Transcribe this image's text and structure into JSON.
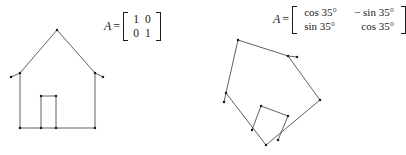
{
  "figure": {
    "background_color": "#ffffff",
    "stroke_color": "#3a3a3a",
    "vertex_color": "#1a1a1a",
    "stroke_width": 0.8,
    "vertex_size": 2.2
  },
  "panels": [
    {
      "id": "original-house",
      "label": "original house",
      "matrix": {
        "variable": "A",
        "equals": "=",
        "rows": [
          [
            "1",
            "0"
          ],
          [
            "0",
            "1"
          ]
        ],
        "description": "identity matrix"
      },
      "shape": {
        "outline": [
          [
            20,
            73
          ],
          [
            57,
            30
          ],
          [
            95,
            73
          ],
          [
            95,
            128
          ],
          [
            20,
            128
          ]
        ],
        "eaves": [
          [
            [
              20,
              73
            ],
            [
              11,
              77
            ]
          ],
          [
            [
              95,
              73
            ],
            [
              103,
              77
            ]
          ]
        ],
        "door": [
          [
            41,
            128
          ],
          [
            41,
            96
          ],
          [
            56,
            96
          ],
          [
            56,
            128
          ]
        ],
        "base": [
          [
            20,
            128
          ],
          [
            95,
            128
          ]
        ],
        "vertices": [
          [
            57,
            30
          ],
          [
            11,
            77
          ],
          [
            20,
            73
          ],
          [
            95,
            73
          ],
          [
            103,
            77
          ],
          [
            20,
            128
          ],
          [
            41,
            128
          ],
          [
            56,
            128
          ],
          [
            95,
            128
          ],
          [
            41,
            96
          ],
          [
            56,
            96
          ]
        ]
      }
    },
    {
      "id": "rotated-house",
      "label": "house rotated 35 degrees",
      "matrix": {
        "variable": "A",
        "equals": "=",
        "rows": [
          [
            "cos 35°",
            "− sin 35°"
          ],
          [
            "sin 35°",
            "cos 35°"
          ]
        ],
        "description": "rotation matrix by 35 degrees"
      },
      "shape": {
        "outline": [
          [
            226,
            93
          ],
          [
            238,
            40
          ],
          [
            288,
            56
          ],
          [
            320,
            100
          ],
          [
            266,
            145
          ]
        ],
        "eaves": [
          [
            [
              226,
              93
            ],
            [
              224,
              102
            ]
          ],
          [
            [
              288,
              56
            ],
            [
              297,
              57
            ]
          ]
        ],
        "door": [
          [
            252,
            130
          ],
          [
            261,
            106
          ],
          [
            288,
            116
          ],
          [
            278,
            140
          ]
        ],
        "base": [
          [
            226,
            93
          ],
          [
            266,
            145
          ]
        ],
        "base2": [
          [
            266,
            145
          ],
          [
            320,
            100
          ]
        ],
        "vertices": [
          [
            238,
            40
          ],
          [
            226,
            93
          ],
          [
            224,
            102
          ],
          [
            288,
            56
          ],
          [
            297,
            57
          ],
          [
            320,
            100
          ],
          [
            266,
            145
          ],
          [
            252,
            130
          ],
          [
            278,
            140
          ],
          [
            261,
            106
          ],
          [
            288,
            116
          ]
        ]
      }
    }
  ]
}
